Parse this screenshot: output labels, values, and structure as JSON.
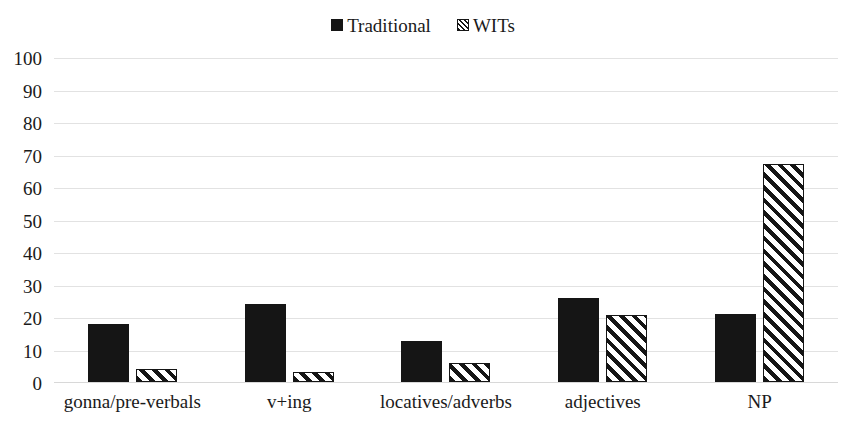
{
  "chart_data": {
    "type": "bar",
    "title": "",
    "subtitle": "",
    "xlabel": "",
    "ylabel": "",
    "ylim": [
      0,
      100
    ],
    "ytick_step": 10,
    "yticks": [
      100,
      90,
      80,
      70,
      60,
      50,
      40,
      30,
      20,
      10,
      0
    ],
    "grid": true,
    "grid_axis": "y",
    "legend_position": "top-center",
    "categories": [
      "gonna/pre-verbals",
      "v+ing",
      "locatives/adverbs",
      "adjectives",
      "NP"
    ],
    "series": [
      {
        "name": "Traditional",
        "fill": "solid",
        "color": "#151515",
        "values": [
          18,
          24,
          12.5,
          26,
          21
        ]
      },
      {
        "name": "WITs",
        "fill": "diagonal-hatch",
        "color": "#151515",
        "values": [
          4,
          3,
          6,
          20.5,
          67
        ]
      }
    ]
  },
  "legend": {
    "entries": [
      {
        "label": "Traditional",
        "marker": "solid-square-icon"
      },
      {
        "label": "WITs",
        "marker": "hatched-square-icon"
      }
    ]
  },
  "colors": {
    "ink": "#151515",
    "gridline": "#e2e2e2",
    "background": "#ffffff"
  }
}
